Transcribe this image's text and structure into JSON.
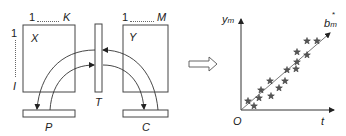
{
  "diagram": {
    "left_panel": {
      "matrix_x": {
        "label": "X",
        "col_start": "1",
        "col_end": "K",
        "row_start": "1",
        "row_end": "I"
      },
      "matrix_y": {
        "label": "Y",
        "col_start": "1",
        "col_end": "M"
      },
      "transform_block": {
        "label": "T"
      },
      "block_p": {
        "label": "P"
      },
      "block_c": {
        "label": "C"
      }
    },
    "transition_arrow": {
      "icon": "hollow-right-arrow"
    },
    "right_panel": {
      "y_axis_label": "y",
      "y_axis_sub": "m",
      "x_axis_label": "t",
      "origin_label": "O",
      "line_label": "b",
      "line_label_sub": "m",
      "line_label_sup": "*"
    },
    "colors": {
      "stroke": "#333333",
      "star_fill": "#555555",
      "background": "#ffffff"
    }
  },
  "chart_data": {
    "type": "scatter",
    "title": "",
    "xlabel": "t",
    "ylabel": "y_m",
    "origin": "O",
    "trend_line": {
      "label": "b_m*",
      "from": [
        0,
        0
      ],
      "to": [
        89,
        77
      ]
    },
    "points": [
      [
        7,
        9
      ],
      [
        13,
        4
      ],
      [
        18,
        12
      ],
      [
        20,
        20
      ],
      [
        29,
        29
      ],
      [
        30,
        14
      ],
      [
        38,
        22
      ],
      [
        44,
        29
      ],
      [
        46,
        40
      ],
      [
        55,
        41
      ],
      [
        56,
        48
      ],
      [
        56,
        58
      ],
      [
        66,
        55
      ],
      [
        66,
        69
      ],
      [
        76,
        69
      ]
    ],
    "grid": false,
    "legend": "none"
  }
}
